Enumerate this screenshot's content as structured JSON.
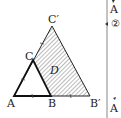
{
  "diagram": {
    "type": "geometry",
    "points": {
      "A": {
        "label": "A",
        "x": 14,
        "y": 96
      },
      "B": {
        "label": "B",
        "x": 51,
        "y": 96
      },
      "B_prime": {
        "label": "B′",
        "x": 90,
        "y": 96
      },
      "C": {
        "label": "C",
        "x": 33,
        "y": 60
      },
      "C_prime": {
        "label": "C′",
        "x": 52,
        "y": 26
      }
    },
    "region_label": "D",
    "tick_marks": "equal segments AB = BB′, AC = CC′",
    "colors": {
      "stroke": "#222222",
      "hatch": "#555555",
      "divider": "#888888"
    }
  },
  "side_panel": {
    "top_label": "A",
    "marker": "②",
    "bottom_label": "A"
  }
}
